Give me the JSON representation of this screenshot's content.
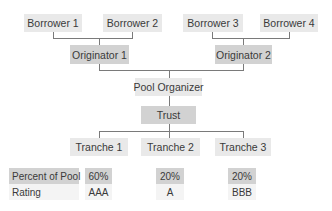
{
  "diagram": {
    "borrowers": [
      {
        "label": "Borrower 1"
      },
      {
        "label": "Borrower 2"
      },
      {
        "label": "Borrower 3"
      },
      {
        "label": "Borrower 4"
      }
    ],
    "originators": [
      {
        "label": "Originator 1"
      },
      {
        "label": "Originator 2"
      }
    ],
    "pool_organizer": {
      "label": "Pool Organizer"
    },
    "trust": {
      "label": "Trust"
    },
    "tranches": [
      {
        "label": "Tranche 1",
        "percent": "60%",
        "rating": "AAA"
      },
      {
        "label": "Tranche 2",
        "percent": "20%",
        "rating": "A"
      },
      {
        "label": "Tranche 3",
        "percent": "20%",
        "rating": "BBB"
      }
    ],
    "table": {
      "percent_label": "Percent of Pool",
      "rating_label": "Rating"
    }
  },
  "colors": {
    "light_box": "#e9e9e9",
    "dark_box": "#d2d2d2",
    "connector": "#7a7a7a",
    "text": "#3a3a3a"
  }
}
